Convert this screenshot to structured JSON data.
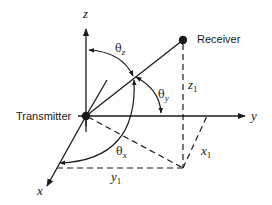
{
  "diagram": {
    "type": "3d-coordinate-geometry",
    "nodes": {
      "transmitter": {
        "label": "Transmitter"
      },
      "receiver": {
        "label": "Receiver"
      }
    },
    "axes": {
      "x": {
        "label": "x"
      },
      "y": {
        "label": "y"
      },
      "z": {
        "label": "z"
      }
    },
    "angles": {
      "theta_z": {
        "symbol": "θ",
        "sub": "z"
      },
      "theta_y": {
        "symbol": "θ",
        "sub": "y"
      },
      "theta_x": {
        "symbol": "θ",
        "sub": "x"
      }
    },
    "distances": {
      "x1": {
        "symbol": "x",
        "sub": "1"
      },
      "y1": {
        "symbol": "y",
        "sub": "1"
      },
      "z1": {
        "symbol": "z",
        "sub": "1"
      }
    },
    "colors": {
      "line": "#1a1a1a",
      "background": "#ffffff"
    }
  }
}
